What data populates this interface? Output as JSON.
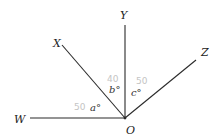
{
  "diagram": {
    "points": {
      "O": "O",
      "W": "W",
      "X": "X",
      "Y": "Y",
      "Z": "Z"
    },
    "angles": {
      "a": "a°",
      "b": "b°",
      "c": "c°"
    },
    "annotations": {
      "a_value": "50",
      "b_value": "40",
      "c_value": "50"
    },
    "colors": {
      "line": "#2a2a2a",
      "annotation": "#c4c4c4"
    }
  }
}
